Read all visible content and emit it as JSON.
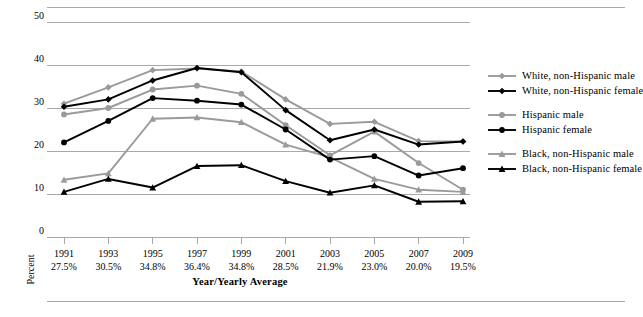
{
  "chart_data": {
    "type": "line",
    "title": "",
    "xlabel": "Year/Yearly Average",
    "ylabel": "Percent",
    "ylim": [
      0,
      50
    ],
    "yticks": [
      "0",
      "10",
      "20",
      "30",
      "40",
      "50"
    ],
    "grid": true,
    "legend_position": "right",
    "categories": [
      "1991",
      "1993",
      "1995",
      "1997",
      "1999",
      "2001",
      "2003",
      "2005",
      "2007",
      "2009"
    ],
    "category_sublabels": [
      "27.5%",
      "30.5%",
      "34.8%",
      "36.4%",
      "34.8%",
      "28.5%",
      "21.9%",
      "23.0%",
      "20.0%",
      "19.5%"
    ],
    "series": [
      {
        "name": "White, non-Hispanic male",
        "color": "#9a9a9a",
        "marker": "diamond",
        "values": [
          31.0,
          34.8,
          38.8,
          39.2,
          38.5,
          32.0,
          26.3,
          26.8,
          22.3,
          22.2
        ]
      },
      {
        "name": "White, non-Hispanic female",
        "color": "#000000",
        "marker": "diamond",
        "values": [
          30.3,
          32.0,
          36.4,
          39.3,
          38.3,
          29.5,
          22.5,
          25.0,
          21.5,
          22.2
        ]
      },
      {
        "name": "Hispanic male",
        "color": "#9a9a9a",
        "marker": "circle",
        "values": [
          28.5,
          30.0,
          34.3,
          35.2,
          33.3,
          26.0,
          19.0,
          24.5,
          17.2,
          11.0
        ]
      },
      {
        "name": "Hispanic female",
        "color": "#000000",
        "marker": "circle",
        "values": [
          22.0,
          27.0,
          32.3,
          31.7,
          30.8,
          25.0,
          18.0,
          18.8,
          14.3,
          16.0
        ]
      },
      {
        "name": "Black, non-Hispanic male",
        "color": "#9a9a9a",
        "marker": "triangle",
        "values": [
          13.3,
          14.8,
          27.5,
          27.8,
          26.7,
          21.5,
          18.5,
          13.5,
          11.0,
          10.5
        ]
      },
      {
        "name": "Black, non-Hispanic female",
        "color": "#000000",
        "marker": "triangle",
        "values": [
          10.5,
          13.5,
          11.5,
          16.5,
          16.7,
          13.0,
          10.3,
          12.0,
          8.2,
          8.3
        ]
      }
    ]
  },
  "legend": {
    "groups": [
      {
        "rows": [
          {
            "label": "White, non-Hispanic male",
            "color": "#9a9a9a",
            "marker": "diamond"
          },
          {
            "label": "White, non-Hispanic female",
            "color": "#000000",
            "marker": "diamond"
          }
        ]
      },
      {
        "rows": [
          {
            "label": "Hispanic male",
            "color": "#9a9a9a",
            "marker": "circle"
          },
          {
            "label": "Hispanic female",
            "color": "#000000",
            "marker": "circle"
          }
        ]
      },
      {
        "rows": [
          {
            "label": "Black, non-Hispanic male",
            "color": "#9a9a9a",
            "marker": "triangle"
          },
          {
            "label": "Black, non-Hispanic female",
            "color": "#000000",
            "marker": "triangle"
          }
        ]
      }
    ]
  },
  "colors": {
    "grid": "#a9a9a9",
    "gray_series": "#9a9a9a",
    "black_series": "#000000",
    "background": "#ffffff"
  }
}
